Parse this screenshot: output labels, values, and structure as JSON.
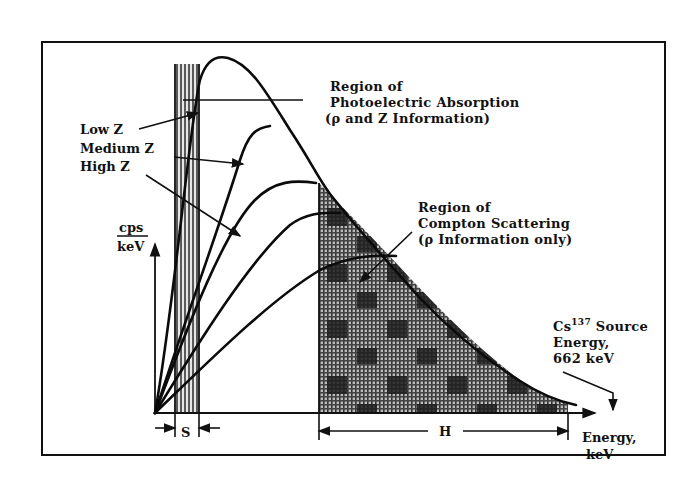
{
  "figure": {
    "photoelectric_label": {
      "line1": "Region of",
      "line2": "Photoelectric Absorption",
      "line3": "(ρ and Z Information)"
    },
    "compton_label": {
      "line1": "Region of",
      "line2": "Compton Scattering",
      "line3": "(ρ Information only)"
    },
    "curve_labels": {
      "low": "Low Z",
      "medium": "Medium Z",
      "high": "High Z"
    },
    "y_axis_label": {
      "numerator": "cps",
      "denominator": "keV"
    },
    "x_axis_label": {
      "line1": "Energy,",
      "line2": "keV"
    },
    "source_label": {
      "line1_prefix": "Cs",
      "line1_sup": "137",
      "line1_suffix": " Source",
      "line2": "Energy,",
      "line3": "662 keV"
    },
    "window_labels": {
      "s": "S",
      "h": "H"
    },
    "colors": {
      "ink": "#111111",
      "background": "#ffffff",
      "hatch_light": "#9a9a9a",
      "hatch_dark": "#2a2a2a"
    }
  }
}
